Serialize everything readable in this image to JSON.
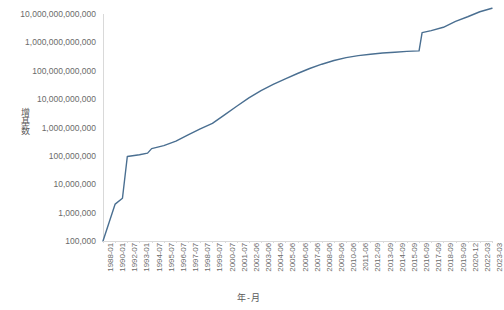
{
  "chart_data": {
    "type": "line",
    "title": "",
    "xlabel": "年-月",
    "ylabel": "增基数",
    "yscale": "log",
    "ylim": [
      100000,
      10000000000000
    ],
    "grid": false,
    "legend": null,
    "line_color": "#4a6f91",
    "y_tick_labels": [
      "10,000,000,000,000",
      "1,000,000,000,000",
      "100,000,000,000",
      "10,000,000,000",
      "1,000,000,000",
      "100,000,000",
      "10,000,000",
      "1,000,000",
      "100,000"
    ],
    "y_tick_values": [
      10000000000000.0,
      1000000000000.0,
      100000000000.0,
      10000000000.0,
      1000000000.0,
      100000000.0,
      10000000.0,
      1000000.0,
      100000.0
    ],
    "x_tick_labels": [
      "1988-01",
      "1990-01",
      "1992-07",
      "1993-01",
      "1994-07",
      "1995-07",
      "1996-07",
      "1997-07",
      "1998-07",
      "1999-07",
      "2000-07",
      "2001-07",
      "2002-06",
      "2003-06",
      "2004-06",
      "2005-06",
      "2006-06",
      "2007-06",
      "2008-06",
      "2009-06",
      "2010-06",
      "2011-06",
      "2012-09",
      "2013-09",
      "2014-09",
      "2015-09",
      "2016-09",
      "2017-09",
      "2018-09",
      "2019-09",
      "2020-12",
      "2022-03",
      "2023-03"
    ],
    "x": [
      "1988-01",
      "1989-01",
      "1990-01",
      "1991-07",
      "1992-07",
      "1993-01",
      "1994-01",
      "1994-07",
      "1995-07",
      "1996-07",
      "1997-07",
      "1998-07",
      "1999-07",
      "2000-07",
      "2001-07",
      "2002-06",
      "2003-06",
      "2004-06",
      "2005-06",
      "2006-06",
      "2007-06",
      "2008-06",
      "2009-06",
      "2010-06",
      "2011-06",
      "2012-09",
      "2013-09",
      "2014-09",
      "2015-09",
      "2016-09",
      "2016-12",
      "2017-09",
      "2018-09",
      "2019-09",
      "2020-12",
      "2022-03",
      "2023-03"
    ],
    "values": [
      100000,
      450000,
      2000000,
      3200000,
      95000000,
      110000000,
      125000000,
      180000000,
      230000000,
      330000000,
      550000000,
      900000000,
      1400000000,
      2800000000,
      5600000000,
      11000000000,
      20000000000,
      33000000000,
      52000000000,
      80000000000,
      120000000000,
      170000000000,
      230000000000,
      290000000000,
      340000000000,
      380000000000,
      420000000000,
      450000000000,
      480000000000,
      500000000000,
      2200000000000,
      2600000000000,
      3400000000000,
      5500000000000,
      8000000000000,
      12000000000000,
      16000000000000
    ],
    "annotations": [
      {
        "text": "sharp vertical jump",
        "at_x": "2016-12"
      }
    ]
  }
}
